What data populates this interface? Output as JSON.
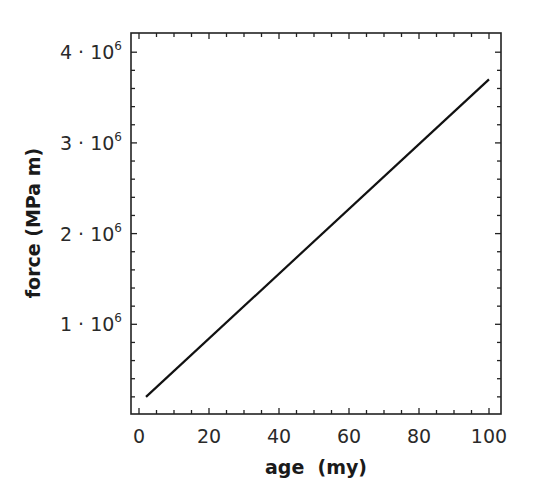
{
  "chart_data": {
    "type": "line",
    "title": "",
    "xlabel": "age  (my)",
    "ylabel": "force (MPa m)",
    "xlim": [
      -2,
      103.5
    ],
    "ylim": [
      0,
      4200000.0
    ],
    "grid": false,
    "legend": null,
    "x_ticks": [
      0,
      20,
      40,
      60,
      80,
      100
    ],
    "x_tick_labels": [
      "0",
      "20",
      "40",
      "60",
      "80",
      "100"
    ],
    "x_minor_step": 5,
    "y_ticks": [
      1000000,
      2000000,
      3000000,
      4000000
    ],
    "y_tick_labels": [
      {
        "mantissa": "1",
        "exp": "6"
      },
      {
        "mantissa": "2",
        "exp": "6"
      },
      {
        "mantissa": "3",
        "exp": "6"
      },
      {
        "mantissa": "4",
        "exp": "6"
      }
    ],
    "y_minor_step": 200000,
    "series": [
      {
        "name": "force",
        "color": "#111111",
        "x": [
          2,
          100
        ],
        "y": [
          200000,
          3700000
        ]
      }
    ]
  },
  "layout": {
    "plot_left": 131,
    "plot_top": 33,
    "plot_right": 501,
    "plot_bottom": 414,
    "x0_px": 139,
    "x_px_per_unit": 3.5,
    "y0_px": 415,
    "y_px_per_unit": 9.07e-05
  }
}
